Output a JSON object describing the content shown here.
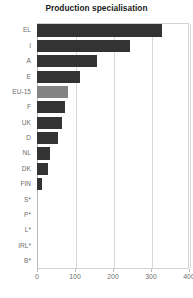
{
  "chart_data": {
    "type": "bar",
    "orientation": "horizontal",
    "title": "Production specialisation",
    "xlabel": "",
    "ylabel": "",
    "xlim": [
      0,
      400
    ],
    "ylim": null,
    "grid": true,
    "legend": null,
    "xticks": [
      0,
      100,
      200,
      300,
      400
    ],
    "xtick_labels": [
      "0",
      "100",
      "200",
      "300",
      "400"
    ],
    "categories": [
      "EL",
      "I",
      "A",
      "E",
      "EU-15",
      "F",
      "UK",
      "D",
      "NL",
      "DK",
      "FIN",
      "S*",
      "P*",
      "L*",
      "IRL*",
      "B*"
    ],
    "values": [
      330,
      245,
      158,
      113,
      82,
      73,
      66,
      55,
      34,
      29,
      13,
      0,
      0,
      0,
      0,
      0
    ],
    "highlight_category": "EU-15",
    "colors": {
      "bar": "#333333",
      "bar_highlight": "#838383",
      "grid": "#d8d8d8",
      "axis": "#b9b9b9",
      "tick_text": "#6d6d6d",
      "title_text": "#1a1a1a",
      "background": "#ffffff"
    },
    "footnote_marker": "*",
    "annotations": []
  }
}
